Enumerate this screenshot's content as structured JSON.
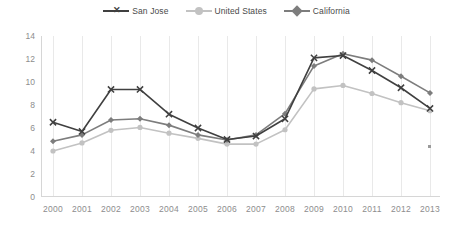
{
  "chart_data": {
    "type": "line",
    "title": "",
    "xlabel": "",
    "ylabel": "",
    "categories": [
      "2000",
      "2001",
      "2002",
      "2003",
      "2004",
      "2005",
      "2006",
      "2007",
      "2008",
      "2009",
      "2010",
      "2011",
      "2012",
      "2013"
    ],
    "ylim": [
      0,
      14
    ],
    "yticks": [
      0,
      2,
      4,
      6,
      8,
      10,
      12,
      14
    ],
    "grid": "vertical",
    "legend_position": "top-center",
    "series": [
      {
        "name": "San Jose",
        "color": "#404040",
        "marker": "x",
        "values": [
          6.5,
          5.7,
          9.35,
          9.35,
          7.2,
          6.0,
          5.0,
          5.3,
          6.8,
          12.1,
          12.3,
          11.0,
          9.5,
          7.7
        ]
      },
      {
        "name": "United States",
        "color": "#c2c2c2",
        "marker": "circle",
        "values": [
          4.0,
          4.7,
          5.8,
          6.05,
          5.55,
          5.1,
          4.6,
          4.6,
          5.85,
          9.4,
          9.7,
          9.0,
          8.2,
          7.5
        ]
      },
      {
        "name": "California",
        "color": "#7d7d7d",
        "marker": "diamond",
        "values": [
          4.85,
          5.4,
          6.7,
          6.8,
          6.25,
          5.4,
          4.95,
          5.4,
          7.25,
          11.4,
          12.45,
          11.9,
          10.5,
          9.05
        ]
      }
    ]
  },
  "legend": {
    "items": [
      {
        "label": "San Jose"
      },
      {
        "label": "United States"
      },
      {
        "label": "California"
      }
    ]
  },
  "axes": {
    "y_labels": [
      "14",
      "12",
      "10",
      "8",
      "6",
      "4",
      "2",
      "0"
    ],
    "x_labels": [
      "2000",
      "2001",
      "2002",
      "2003",
      "2004",
      "2005",
      "2006",
      "2007",
      "2008",
      "2009",
      "2010",
      "2011",
      "2012",
      "2013"
    ]
  }
}
